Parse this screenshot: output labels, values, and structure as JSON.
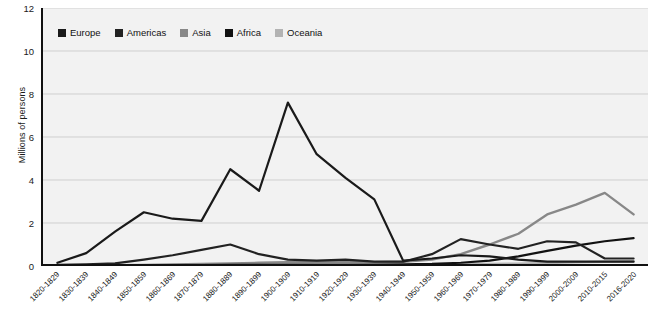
{
  "chart_data": {
    "type": "line",
    "title": "",
    "subtitle": "",
    "xlabel": "",
    "ylabel": "Millions of persons",
    "ylim": [
      0,
      12
    ],
    "yticks": [
      0,
      2,
      4,
      6,
      8,
      10,
      12
    ],
    "grid": true,
    "legend_position": "top-left-inside",
    "categories": [
      "1820-1829",
      "1830-1839",
      "1840-1849",
      "1850-1859",
      "1860-1869",
      "1870-1879",
      "1880-1889",
      "1890-1899",
      "1900-1909",
      "1910-1919",
      "1920-1929",
      "1930-1939",
      "1940-1949",
      "1950-1959",
      "1960-1969",
      "1970-1979",
      "1980-1989",
      "1990-1999",
      "2000-2009",
      "2010-2015",
      "2016-2020"
    ],
    "series": [
      {
        "name": "Europe",
        "color": "#1a1a1a",
        "values": [
          0.15,
          0.6,
          1.6,
          2.5,
          2.2,
          2.1,
          4.5,
          3.5,
          7.6,
          5.2,
          4.1,
          3.1,
          0.25,
          0.35,
          0.5,
          0.45,
          0.3,
          0.2,
          0.2,
          0.2,
          0.2
        ]
      },
      {
        "name": "Americas",
        "color": "#222222",
        "values": [
          0.05,
          0.08,
          0.12,
          0.3,
          0.5,
          0.75,
          1.0,
          0.55,
          0.3,
          0.25,
          0.3,
          0.2,
          0.2,
          0.55,
          1.25,
          1.0,
          0.8,
          1.15,
          1.1,
          0.35,
          0.35
        ]
      },
      {
        "name": "Asia",
        "color": "#888888",
        "values": [
          0.02,
          0.03,
          0.04,
          0.05,
          0.07,
          0.1,
          0.12,
          0.15,
          0.18,
          0.2,
          0.2,
          0.18,
          0.2,
          0.3,
          0.55,
          1.0,
          1.5,
          2.4,
          2.85,
          3.4,
          2.4
        ]
      },
      {
        "name": "Africa",
        "color": "#111111",
        "values": [
          0.01,
          0.01,
          0.02,
          0.02,
          0.03,
          0.04,
          0.05,
          0.05,
          0.06,
          0.06,
          0.07,
          0.07,
          0.08,
          0.1,
          0.15,
          0.25,
          0.45,
          0.7,
          0.95,
          1.15,
          1.3
        ]
      },
      {
        "name": "Oceania",
        "color": "#b3b3b3",
        "values": [
          0.0,
          0.0,
          0.01,
          0.01,
          0.01,
          0.02,
          0.02,
          0.02,
          0.03,
          0.03,
          0.03,
          0.03,
          0.04,
          0.05,
          0.07,
          0.09,
          0.11,
          0.14,
          0.17,
          0.2,
          0.22
        ]
      }
    ]
  },
  "legend": {
    "items": [
      {
        "label": "Europe",
        "color": "#1a1a1a"
      },
      {
        "label": "Americas",
        "color": "#222222"
      },
      {
        "label": "Asia",
        "color": "#888888"
      },
      {
        "label": "Africa",
        "color": "#111111"
      },
      {
        "label": "Oceania",
        "color": "#b3b3b3"
      }
    ]
  },
  "axes": {
    "y_title": "Millions of persons"
  }
}
